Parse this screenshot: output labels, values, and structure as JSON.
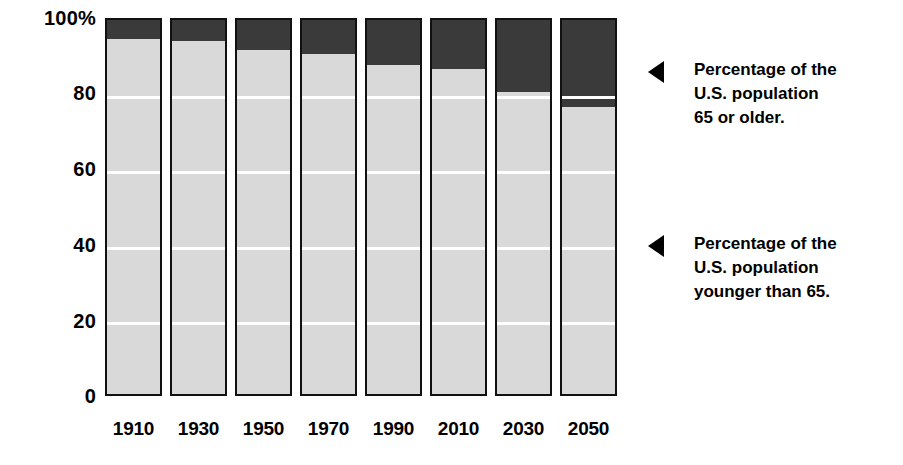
{
  "chart_data": {
    "type": "bar",
    "subtype": "stacked-100-percent",
    "title": "",
    "xlabel": "",
    "ylabel": "",
    "categories": [
      "1910",
      "1930",
      "1950",
      "1970",
      "1990",
      "2010",
      "2030",
      "2050"
    ],
    "series": [
      {
        "name": "Percentage of the U.S. population younger than 65.",
        "color": "#d9d9d9",
        "values": [
          95,
          94.5,
          92,
          91,
          88,
          87,
          81,
          77
        ]
      },
      {
        "name": "Percentage of the U.S. population 65 or older.",
        "color": "#3a3a3a",
        "values": [
          5,
          5.5,
          8,
          9,
          12,
          13,
          19,
          23
        ]
      }
    ],
    "ylim": [
      0,
      100
    ],
    "yticks": [
      0,
      20,
      40,
      60,
      80,
      100
    ],
    "ytick_labels": [
      "0",
      "20",
      "40",
      "60",
      "80",
      "100%"
    ],
    "grid": true,
    "grid_color": "#ffffff",
    "legend_position": "right"
  },
  "axes": {
    "y_labels": [
      {
        "value": 100,
        "text": "100%"
      },
      {
        "value": 80,
        "text": "80"
      },
      {
        "value": 60,
        "text": "60"
      },
      {
        "value": 40,
        "text": "40"
      },
      {
        "value": 20,
        "text": "20"
      },
      {
        "value": 0,
        "text": "0"
      }
    ],
    "x_labels": [
      "1910",
      "1930",
      "1950",
      "1970",
      "1990",
      "2010",
      "2030",
      "2050"
    ]
  },
  "legend": {
    "items": [
      {
        "marker": "left-triangle-marker",
        "lines": "Percentage of the\nU.S. population\n65 or older.",
        "target_series": "older"
      },
      {
        "marker": "left-triangle-marker",
        "lines": "Percentage of the\nU.S. population\nyounger than 65.",
        "target_series": "younger"
      }
    ]
  },
  "colors": {
    "background": "#ffffff",
    "bar_light": "#d9d9d9",
    "bar_dark": "#3a3a3a",
    "bar_outline": "#111111",
    "gridline": "#ffffff",
    "text": "#000000"
  }
}
